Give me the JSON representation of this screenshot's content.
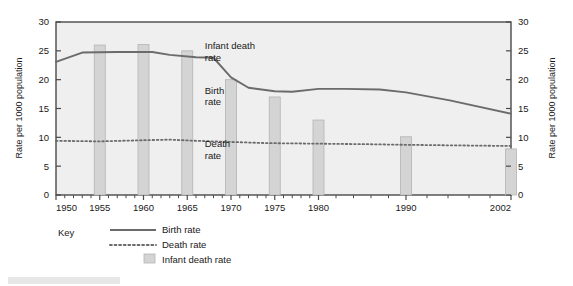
{
  "figure": {
    "background_color": "#ffffff",
    "plot_background_color": "#efefef",
    "axis_color": "#4a4a4a"
  },
  "chart_data": {
    "type": "bar",
    "title": "",
    "subtitle": "",
    "xlabel": "",
    "ylabel": "Rate per 1000 population",
    "ylabel_right": "Rate per 1000 population",
    "ylim": [
      0,
      30
    ],
    "yticks": [
      0,
      5,
      10,
      15,
      20,
      25,
      30
    ],
    "yticks_right": [
      0,
      5,
      10,
      15,
      20,
      25,
      30
    ],
    "xlim": [
      1950,
      2002
    ],
    "xticks": [
      1950,
      1955,
      1960,
      1965,
      1970,
      1975,
      1980,
      1990,
      2002
    ],
    "minor_xticks_per_interval": 4,
    "grid": false,
    "legend_position": "below-left",
    "legend_title": "Key",
    "bar_color": "#d4d4d4",
    "bar_edge_color": "#b4b4b4",
    "line_color": "#6b6b6b",
    "categories": [
      1955,
      1960,
      1965,
      1970,
      1975,
      1980,
      1990,
      2002
    ],
    "values": [
      26,
      26.1,
      25,
      20,
      17,
      13,
      10.1,
      8
    ],
    "series": [
      {
        "name": "Infant death rate",
        "type": "bar",
        "x": [
          1955,
          1960,
          1965,
          1970,
          1975,
          1980,
          1990,
          2002
        ],
        "values": [
          26,
          26.1,
          25,
          20,
          17,
          13,
          10.1,
          8
        ],
        "color": "#d4d4d4",
        "style": "bar"
      },
      {
        "name": "Birth rate",
        "type": "line",
        "x": [
          1950,
          1953,
          1957,
          1961,
          1963,
          1966,
          1968,
          1970,
          1972,
          1975,
          1977,
          1980,
          1983,
          1987,
          1990,
          1995,
          2002
        ],
        "values": [
          23.1,
          24.7,
          24.8,
          24.8,
          24.3,
          23.9,
          23.8,
          20.4,
          18.6,
          18.0,
          17.9,
          18.4,
          18.4,
          18.3,
          17.8,
          16.4,
          14.1
        ],
        "color": "#6b6b6b",
        "style": "solid"
      },
      {
        "name": "Death rate",
        "type": "line",
        "x": [
          1950,
          1955,
          1960,
          1963,
          1966,
          1970,
          1974,
          1980,
          1986,
          1990,
          1996,
          2002
        ],
        "values": [
          9.4,
          9.3,
          9.5,
          9.6,
          9.4,
          9.2,
          9.0,
          8.9,
          8.8,
          8.7,
          8.6,
          8.5
        ],
        "color": "#6b6b6b",
        "style": "dotted"
      }
    ],
    "annotations": [
      {
        "text": "Infant death",
        "x": 1967.0,
        "y": 25.3
      },
      {
        "text": "rate",
        "x": 1967.0,
        "y": 23.3
      },
      {
        "text": "Birth",
        "x": 1967.0,
        "y": 17.6
      },
      {
        "text": "rate",
        "x": 1967.0,
        "y": 15.6
      },
      {
        "text": "Death",
        "x": 1967.0,
        "y": 8.3
      },
      {
        "text": "rate",
        "x": 1967.0,
        "y": 6.3
      }
    ],
    "legend_entries": [
      {
        "label": "Birth rate",
        "marker": "solid-line",
        "color": "#6b6b6b"
      },
      {
        "label": "Death rate",
        "marker": "dotted-line",
        "color": "#6b6b6b"
      },
      {
        "label": "Infant death rate",
        "marker": "filled-square",
        "color": "#d4d4d4"
      }
    ]
  }
}
